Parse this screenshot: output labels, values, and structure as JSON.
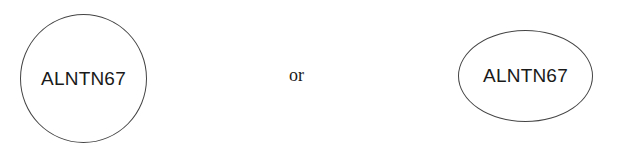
{
  "shapes": [
    {
      "type": "circle",
      "label": "ALNTN67"
    },
    {
      "type": "ellipse",
      "label": "ALNTN67"
    }
  ],
  "connector_text": "or",
  "colors": {
    "stroke": "#444444",
    "text": "#1a1a1a",
    "background": "#ffffff"
  }
}
